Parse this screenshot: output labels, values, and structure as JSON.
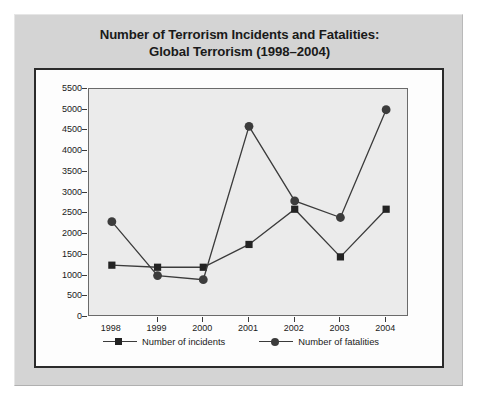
{
  "chart_data": {
    "type": "line",
    "title": "Number of Terrorism Incidents and Fatalities:",
    "subtitle": "Global Terrorism (1998–2004)",
    "title_full": "Number of Terrorism Incidents and Fatalities: Global Terrorism (1998–2004)",
    "xlabel": "",
    "ylabel": "",
    "categories": [
      "1998",
      "1999",
      "2000",
      "2001",
      "2002",
      "2003",
      "2004"
    ],
    "x": [
      1998,
      1999,
      2000,
      2001,
      2002,
      2003,
      2004
    ],
    "series": [
      {
        "name": "Number of incidents",
        "marker": "square",
        "color": "#232323",
        "values": [
          1250,
          1200,
          1200,
          1750,
          2600,
          1450,
          2600
        ]
      },
      {
        "name": "Number of fatalities",
        "marker": "circle",
        "color": "#3c3c3c",
        "values": [
          2300,
          1000,
          900,
          4600,
          2800,
          2400,
          5000
        ]
      }
    ],
    "ylim": [
      0,
      5500
    ],
    "ytick_step": 500,
    "ytick_labels": [
      "0",
      "500",
      "1000",
      "1500",
      "2000",
      "2500",
      "3000",
      "3500",
      "4000",
      "4500",
      "5000",
      "5500"
    ],
    "grid": false,
    "legend_position": "bottom",
    "plot_background": "#ebebeb",
    "panel_background": "#d4d4d4",
    "chart_background": "#fdfdfd",
    "line_color": "#3b3b3b"
  }
}
